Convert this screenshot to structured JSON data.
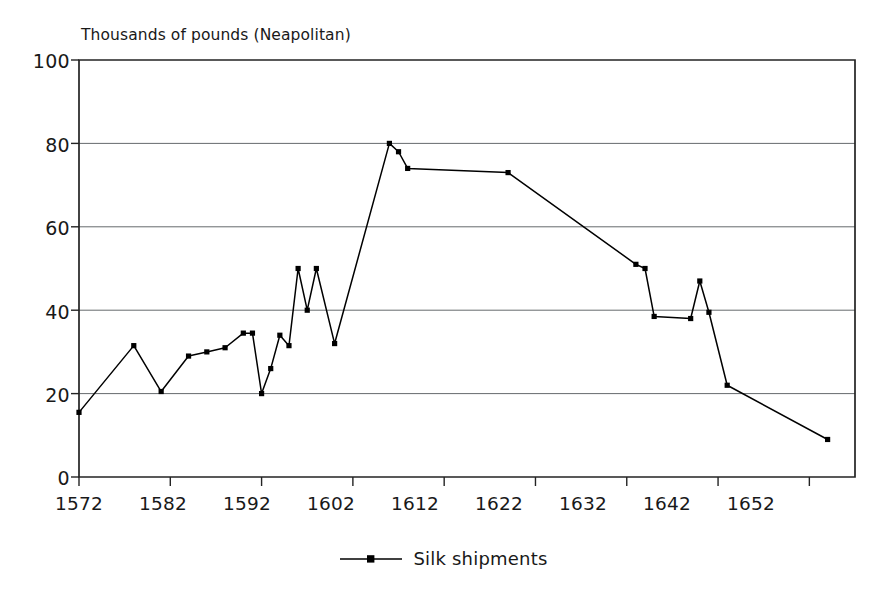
{
  "chart_data": {
    "type": "line",
    "title": "Thousands of pounds (Neapolitan)",
    "subtitle": "",
    "xlabel": "",
    "ylabel": "Thousands of pounds (Neapolitan)",
    "xlim": [
      1572,
      1657
    ],
    "ylim": [
      0,
      100
    ],
    "grid": "horizontal",
    "legend_position": "bottom-center",
    "xticks": [
      "1572",
      "1582",
      "1592",
      "1602",
      "1612",
      "1622",
      "1632",
      "1642",
      "1652"
    ],
    "xtick_values": [
      1572,
      1582,
      1592,
      1602,
      1612,
      1622,
      1632,
      1642,
      1652
    ],
    "yticks": [
      "0",
      "20",
      "40",
      "60",
      "80",
      "100"
    ],
    "ytick_values": [
      0,
      20,
      40,
      60,
      80,
      100
    ],
    "series": [
      {
        "name": "Silk shipments",
        "marker": "square",
        "color": "#000000",
        "x": [
          1572,
          1578,
          1581,
          1584,
          1586,
          1588,
          1590,
          1591,
          1592,
          1593,
          1594,
          1595,
          1596,
          1597,
          1598,
          1600,
          1606,
          1607,
          1608,
          1619,
          1633,
          1634,
          1635,
          1639,
          1640,
          1641,
          1643,
          1654
        ],
        "values": [
          15.5,
          31.5,
          20.5,
          29,
          30,
          31,
          34.5,
          34.5,
          20,
          26,
          34,
          31.5,
          50,
          40,
          50,
          32,
          80,
          78,
          74,
          73,
          51,
          50,
          38.5,
          38,
          47,
          39.5,
          22,
          9
        ]
      }
    ]
  },
  "legend": {
    "entries": [
      {
        "label": "Silk shipments",
        "marker": "line-with-square-marker"
      }
    ]
  }
}
